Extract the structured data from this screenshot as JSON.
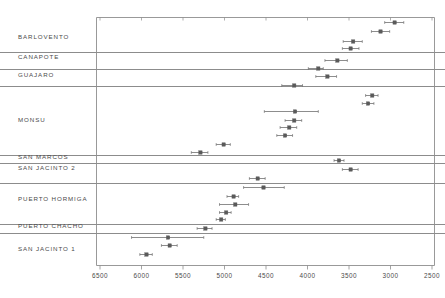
{
  "chart_data": {
    "type": "scatter",
    "title": "",
    "subtitle": "",
    "xlabel": "",
    "ylabel": "",
    "xlim": [
      6500,
      2500
    ],
    "x_reversed": true,
    "grid": false,
    "legend": null,
    "x_ticks": [
      6500,
      6000,
      5500,
      5000,
      4500,
      4000,
      3500,
      3000,
      2500
    ],
    "x_tick_labels": [
      "6500",
      "6000",
      "5500",
      "5000",
      "4500",
      "4000",
      "3500",
      "3000",
      "2500"
    ],
    "groups": [
      {
        "label": "BARLOVENTO",
        "points": [
          {
            "value": 2950,
            "low": 3070,
            "high": 2840
          },
          {
            "value": 3120,
            "low": 3230,
            "high": 3010
          },
          {
            "value": 3450,
            "low": 3570,
            "high": 3340
          },
          {
            "value": 3480,
            "low": 3580,
            "high": 3380
          }
        ]
      },
      {
        "label": "CANAPOTE",
        "points": [
          {
            "value": 3640,
            "low": 3790,
            "high": 3520
          }
        ]
      },
      {
        "label": "GUAJARO",
        "points": [
          {
            "value": 3870,
            "low": 3990,
            "high": 3810
          },
          {
            "value": 3760,
            "low": 3900,
            "high": 3650
          }
        ]
      },
      {
        "label": "MONSU",
        "points": [
          {
            "value": 4160,
            "low": 4310,
            "high": 4060
          },
          {
            "value": 3220,
            "low": 3300,
            "high": 3150
          },
          {
            "value": 3270,
            "low": 3340,
            "high": 3200
          },
          {
            "value": 4150,
            "low": 4520,
            "high": 3870
          },
          {
            "value": 4160,
            "low": 4270,
            "high": 4070
          },
          {
            "value": 4220,
            "low": 4330,
            "high": 4130
          },
          {
            "value": 4270,
            "low": 4370,
            "high": 4180
          }
        ]
      },
      {
        "label": "SAN MARCOS",
        "points": [
          {
            "value": 5010,
            "low": 5100,
            "high": 4930
          },
          {
            "value": 5290,
            "low": 5400,
            "high": 5200
          },
          {
            "value": 3620,
            "low": 3680,
            "high": 3560
          }
        ]
      },
      {
        "label": "SAN JACINTO 2",
        "points": [
          {
            "value": 3480,
            "low": 3580,
            "high": 3390
          }
        ]
      },
      {
        "label": "PUERTO HORMIGA",
        "points": [
          {
            "value": 4600,
            "low": 4700,
            "high": 4510
          },
          {
            "value": 4530,
            "low": 4770,
            "high": 4280
          },
          {
            "value": 4890,
            "low": 4970,
            "high": 4830
          },
          {
            "value": 4870,
            "low": 5060,
            "high": 4710
          },
          {
            "value": 4980,
            "low": 5060,
            "high": 4920
          },
          {
            "value": 5040,
            "low": 5100,
            "high": 4990
          }
        ]
      },
      {
        "label": "PUERTO CHACHO",
        "points": [
          {
            "value": 5230,
            "low": 5330,
            "high": 5150
          }
        ]
      },
      {
        "label": "SAN JACINTO 1",
        "points": [
          {
            "value": 5680,
            "low": 6120,
            "high": 5250
          },
          {
            "value": 5660,
            "low": 5760,
            "high": 5570
          },
          {
            "value": 5940,
            "low": 6020,
            "high": 5870
          }
        ]
      }
    ]
  },
  "style": {
    "axis_color": "#8d8d8d",
    "marker_color": "#5a5a5a",
    "whisker_color": "#707070",
    "separator_color": "#6e6e6e",
    "text_color": "#4a4a4a",
    "background": "#ffffff"
  },
  "geometry": {
    "plot_left": 96,
    "plot_right": 434,
    "plot_top": 17,
    "plot_bottom": 265,
    "x_at_6500": 100,
    "x_at_2500": 432,
    "label_x": 18,
    "tick_label_y": 273,
    "separators_y": [
      52,
      69,
      86,
      155,
      163,
      183,
      224,
      233
    ],
    "group_label_y": [
      38,
      58,
      76,
      121,
      158,
      169,
      200,
      227,
      250
    ],
    "rows": [
      {
        "group": 0,
        "y": 22
      },
      {
        "group": 0,
        "y": 31
      },
      {
        "group": 0,
        "y": 41
      },
      {
        "group": 0,
        "y": 48
      },
      {
        "group": 1,
        "y": 60
      },
      {
        "group": 2,
        "y": 68
      },
      {
        "group": 2,
        "y": 76
      },
      {
        "group": 3,
        "y": 85
      },
      {
        "group": 3,
        "y": 95
      },
      {
        "group": 3,
        "y": 103
      },
      {
        "group": 3,
        "y": 111
      },
      {
        "group": 3,
        "y": 120
      },
      {
        "group": 3,
        "y": 127
      },
      {
        "group": 3,
        "y": 135
      },
      {
        "group": 4,
        "y": 144
      },
      {
        "group": 4,
        "y": 152
      },
      {
        "group": 4,
        "y": 160
      },
      {
        "group": 5,
        "y": 169
      },
      {
        "group": 6,
        "y": 178
      },
      {
        "group": 6,
        "y": 187
      },
      {
        "group": 6,
        "y": 196
      },
      {
        "group": 6,
        "y": 204
      },
      {
        "group": 6,
        "y": 212
      },
      {
        "group": 6,
        "y": 219
      },
      {
        "group": 7,
        "y": 228
      },
      {
        "group": 8,
        "y": 237
      },
      {
        "group": 8,
        "y": 245
      },
      {
        "group": 8,
        "y": 254
      }
    ]
  }
}
